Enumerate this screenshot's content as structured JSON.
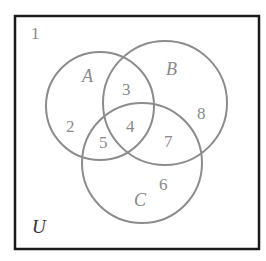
{
  "diagram": {
    "type": "venn-diagram",
    "universe_label": "U",
    "outside_region": "1",
    "sets": [
      {
        "name": "A",
        "cx": 100,
        "cy": 106,
        "r": 54
      },
      {
        "name": "B",
        "cx": 165,
        "cy": 103,
        "r": 62
      },
      {
        "name": "C",
        "cx": 142,
        "cy": 163,
        "r": 60
      }
    ],
    "regions": {
      "only_A": "2",
      "A_and_B_only": "3",
      "A_and_B_and_C": "4",
      "A_and_C_only": "5",
      "only_C": "6",
      "B_and_C_only": "7",
      "only_B": "8",
      "outside": "1"
    },
    "colors": {
      "border": "#1a1a1a",
      "circle": "#8c8c8c",
      "text": "#8a8a8a"
    }
  }
}
